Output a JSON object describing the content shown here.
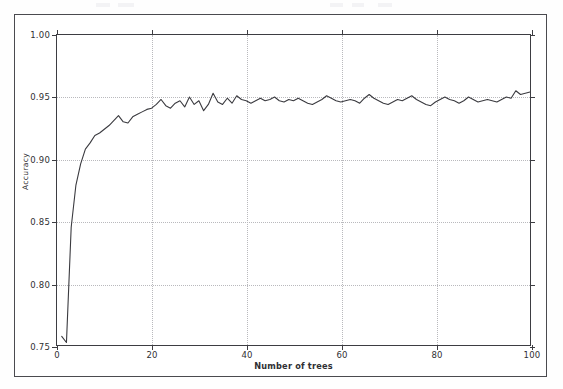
{
  "figure": {
    "border_color": "#4a4a4f",
    "background": "#ffffff"
  },
  "scan_artifacts": [
    {
      "x": 96,
      "y": 3,
      "w": 14
    },
    {
      "x": 118,
      "y": 3,
      "w": 16
    },
    {
      "x": 330,
      "y": 3,
      "w": 13
    },
    {
      "x": 352,
      "y": 3,
      "w": 12
    },
    {
      "x": 378,
      "y": 3,
      "w": 14
    }
  ],
  "chart_data": {
    "type": "line",
    "title": "",
    "xlabel": "Number of trees",
    "ylabel": "Accuracy",
    "xlim": [
      0,
      100
    ],
    "ylim": [
      0.75,
      1.0
    ],
    "grid": true,
    "grid_style": "dotted",
    "legend": null,
    "line_color": "#3a3a3f",
    "line_width": 1.1,
    "xticks": [
      0,
      20,
      40,
      60,
      80,
      100
    ],
    "xtick_labels": [
      "0",
      "20",
      "40",
      "60",
      "80",
      "100"
    ],
    "yticks": [
      0.75,
      0.8,
      0.85,
      0.9,
      0.95,
      1.0
    ],
    "ytick_labels": [
      "0.75",
      "0.80",
      "0.85",
      "0.90",
      "0.95",
      "1.00"
    ],
    "series": [
      {
        "name": "Accuracy",
        "x": [
          1,
          2,
          3,
          4,
          5,
          6,
          7,
          8,
          9,
          10,
          11,
          12,
          13,
          14,
          15,
          16,
          17,
          18,
          19,
          20,
          21,
          22,
          23,
          24,
          25,
          26,
          27,
          28,
          29,
          30,
          31,
          32,
          33,
          34,
          35,
          36,
          37,
          38,
          39,
          40,
          41,
          42,
          43,
          44,
          45,
          46,
          47,
          48,
          49,
          50,
          51,
          52,
          53,
          54,
          55,
          56,
          57,
          58,
          59,
          60,
          61,
          62,
          63,
          64,
          65,
          66,
          67,
          68,
          69,
          70,
          71,
          72,
          73,
          74,
          75,
          76,
          77,
          78,
          79,
          80,
          81,
          82,
          83,
          84,
          85,
          86,
          87,
          88,
          89,
          90,
          91,
          92,
          93,
          94,
          95,
          96,
          97,
          98,
          99,
          100
        ],
        "values": [
          0.757,
          0.752,
          0.845,
          0.879,
          0.896,
          0.908,
          0.913,
          0.919,
          0.921,
          0.924,
          0.927,
          0.931,
          0.935,
          0.93,
          0.929,
          0.934,
          0.936,
          0.938,
          0.94,
          0.941,
          0.944,
          0.948,
          0.943,
          0.941,
          0.945,
          0.947,
          0.942,
          0.95,
          0.944,
          0.947,
          0.939,
          0.944,
          0.953,
          0.946,
          0.944,
          0.949,
          0.945,
          0.951,
          0.948,
          0.947,
          0.945,
          0.947,
          0.949,
          0.947,
          0.948,
          0.95,
          0.947,
          0.946,
          0.948,
          0.947,
          0.949,
          0.947,
          0.945,
          0.944,
          0.946,
          0.948,
          0.951,
          0.949,
          0.947,
          0.946,
          0.947,
          0.948,
          0.947,
          0.945,
          0.949,
          0.952,
          0.949,
          0.947,
          0.945,
          0.944,
          0.946,
          0.948,
          0.947,
          0.949,
          0.951,
          0.948,
          0.946,
          0.944,
          0.943,
          0.946,
          0.948,
          0.95,
          0.948,
          0.947,
          0.945,
          0.947,
          0.95,
          0.948,
          0.946,
          0.947,
          0.948,
          0.947,
          0.946,
          0.948,
          0.95,
          0.949,
          0.955,
          0.952,
          0.953,
          0.954
        ]
      }
    ]
  }
}
